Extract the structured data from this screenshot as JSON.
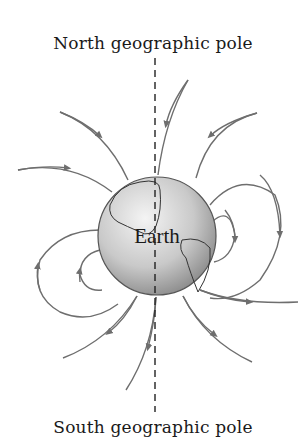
{
  "diagram": {
    "title_top": "North geographic pole",
    "title_bottom": "South geographic pole",
    "globe_label": "Earth",
    "axis_style": "dashed vertical line",
    "colors": {
      "field_line": "#6e6e6e",
      "axis": "#222222",
      "globe_light": "#f2f2f2",
      "globe_dark": "#8a8a8a",
      "text": "#1a1a1a"
    }
  }
}
